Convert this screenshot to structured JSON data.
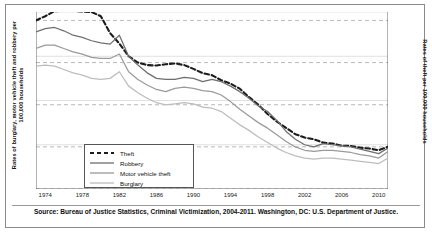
{
  "figure": {
    "source_note": "Source: Bureau of Justice Statistics, Criminal Victimization, 2004-2011. Washington, DC: U.S. Department of Justice."
  },
  "axes": {
    "left_title": "Rates of burglary, motor vehicle theft and robbery per 100,000 households",
    "right_title": "Rates of theft per 100,000 households",
    "left_ticks": [
      "0",
      "40",
      "80",
      "120",
      "160"
    ],
    "right_ticks": [
      "0",
      "100",
      "200",
      "300",
      "400"
    ],
    "x_ticks": [
      "1974",
      "1978",
      "1982",
      "1986",
      "1990",
      "1994",
      "1998",
      "2002",
      "2006",
      "2010"
    ]
  },
  "legend": {
    "items": [
      {
        "label": "Theft",
        "style": "dashed",
        "color": "#1c1c1c"
      },
      {
        "label": "Robbery",
        "style": "solid",
        "color": "#6e6e6e"
      },
      {
        "label": "Motor vehicle theft",
        "style": "solid",
        "color": "#9a9a9a"
      },
      {
        "label": "Burglary",
        "style": "solid",
        "color": "#bdbdbd"
      }
    ]
  },
  "chart_data": {
    "type": "line",
    "title": "",
    "xlabel": "",
    "ylabel": "Rates of burglary, motor vehicle theft and robbery per 100,000 households",
    "ylabel_right": "Rates of theft per 100,000 households",
    "grid": true,
    "legend_position": "inside-bottom-left",
    "xlim": [
      1973,
      2011
    ],
    "ylim": [
      0,
      160
    ],
    "ylim_right": [
      0,
      420
    ],
    "x": [
      1973,
      1974,
      1975,
      1976,
      1977,
      1978,
      1979,
      1980,
      1981,
      1982,
      1983,
      1984,
      1985,
      1986,
      1987,
      1988,
      1989,
      1990,
      1991,
      1992,
      1993,
      1994,
      1995,
      1996,
      1997,
      1998,
      1999,
      2000,
      2001,
      2002,
      2003,
      2004,
      2005,
      2006,
      2007,
      2008,
      2009,
      2010,
      2011
    ],
    "series": [
      {
        "name": "Theft",
        "axis": "right",
        "color": "#1c1c1c",
        "style": "dashed",
        "values": [
          400,
          410,
          422,
          423,
          423,
          421,
          420,
          410,
          370,
          345,
          315,
          300,
          294,
          293,
          296,
          298,
          294,
          285,
          275,
          270,
          258,
          250,
          238,
          218,
          200,
          178,
          160,
          145,
          130,
          122,
          118,
          110,
          108,
          103,
          102,
          98,
          96,
          92,
          100
        ]
      },
      {
        "name": "Robbery",
        "axis": "left",
        "color": "#6e6e6e",
        "style": "solid",
        "values": [
          142,
          145,
          146,
          143,
          139,
          137,
          134,
          132,
          131,
          139,
          120,
          112,
          105,
          100,
          99,
          99,
          101,
          100,
          97,
          99,
          97,
          93,
          88,
          82,
          75,
          70,
          62,
          52,
          45,
          40,
          38,
          41,
          40,
          39,
          38,
          36,
          34,
          32,
          37
        ]
      },
      {
        "name": "Motor vehicle theft",
        "axis": "left",
        "color": "#9a9a9a",
        "style": "solid",
        "values": [
          127,
          130,
          130,
          127,
          124,
          122,
          119,
          118,
          118,
          122,
          106,
          99,
          94,
          90,
          88,
          91,
          92,
          91,
          89,
          88,
          85,
          79,
          72,
          66,
          60,
          55,
          49,
          43,
          38,
          35,
          34,
          35,
          35,
          34,
          33,
          31,
          30,
          28,
          34
        ]
      },
      {
        "name": "Burglary",
        "axis": "left",
        "color": "#bdbdbd",
        "style": "solid",
        "values": [
          111,
          112,
          111,
          108,
          105,
          103,
          100,
          99,
          100,
          106,
          93,
          87,
          82,
          78,
          76,
          77,
          78,
          77,
          74,
          73,
          70,
          64,
          58,
          53,
          47,
          42,
          37,
          33,
          30,
          28,
          27,
          28,
          28,
          27,
          26,
          25,
          24,
          23,
          28
        ]
      }
    ]
  }
}
